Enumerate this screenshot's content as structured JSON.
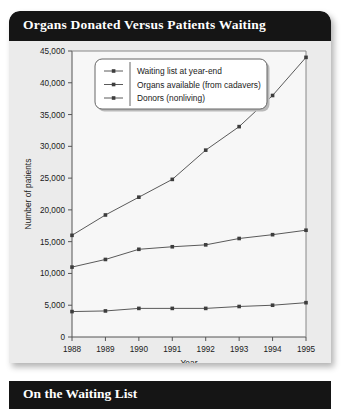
{
  "card": {
    "title": "Organs Donated Versus Patients Waiting"
  },
  "bottom_bar": {
    "title": "On the Waiting List"
  },
  "chart_data": {
    "type": "line",
    "title": "Organs Donated Versus Patients Waiting",
    "xlabel": "Year",
    "ylabel": "Number of patients",
    "categories": [
      "1988",
      "1989",
      "1990",
      "1991",
      "1992",
      "1993",
      "1994",
      "1995"
    ],
    "x": [
      1988,
      1989,
      1990,
      1991,
      1992,
      1993,
      1994,
      1995
    ],
    "xlim": [
      1988,
      1995
    ],
    "ylim": [
      0,
      45000
    ],
    "ytick_labels": [
      "0",
      "5,000",
      "10,000",
      "15,000",
      "20,000",
      "25,000",
      "30,000",
      "35,000",
      "40,000",
      "45,000"
    ],
    "yticks": [
      0,
      5000,
      10000,
      15000,
      20000,
      25000,
      30000,
      35000,
      40000,
      45000
    ],
    "grid": false,
    "legend_position": "top-left-inside",
    "series": [
      {
        "name": "Waiting list at year-end",
        "color": "#5a5a5a",
        "values": [
          16000,
          19200,
          22000,
          24800,
          29400,
          33100,
          38000,
          44000
        ]
      },
      {
        "name": "Organs available (from cadavers)",
        "color": "#5a5a5a",
        "values": [
          11000,
          12200,
          13800,
          14200,
          14500,
          15500,
          16100,
          16800
        ]
      },
      {
        "name": "Donors (nonliving)",
        "color": "#5a5a5a",
        "values": [
          4000,
          4100,
          4500,
          4500,
          4500,
          4800,
          5000,
          5400
        ]
      }
    ]
  }
}
